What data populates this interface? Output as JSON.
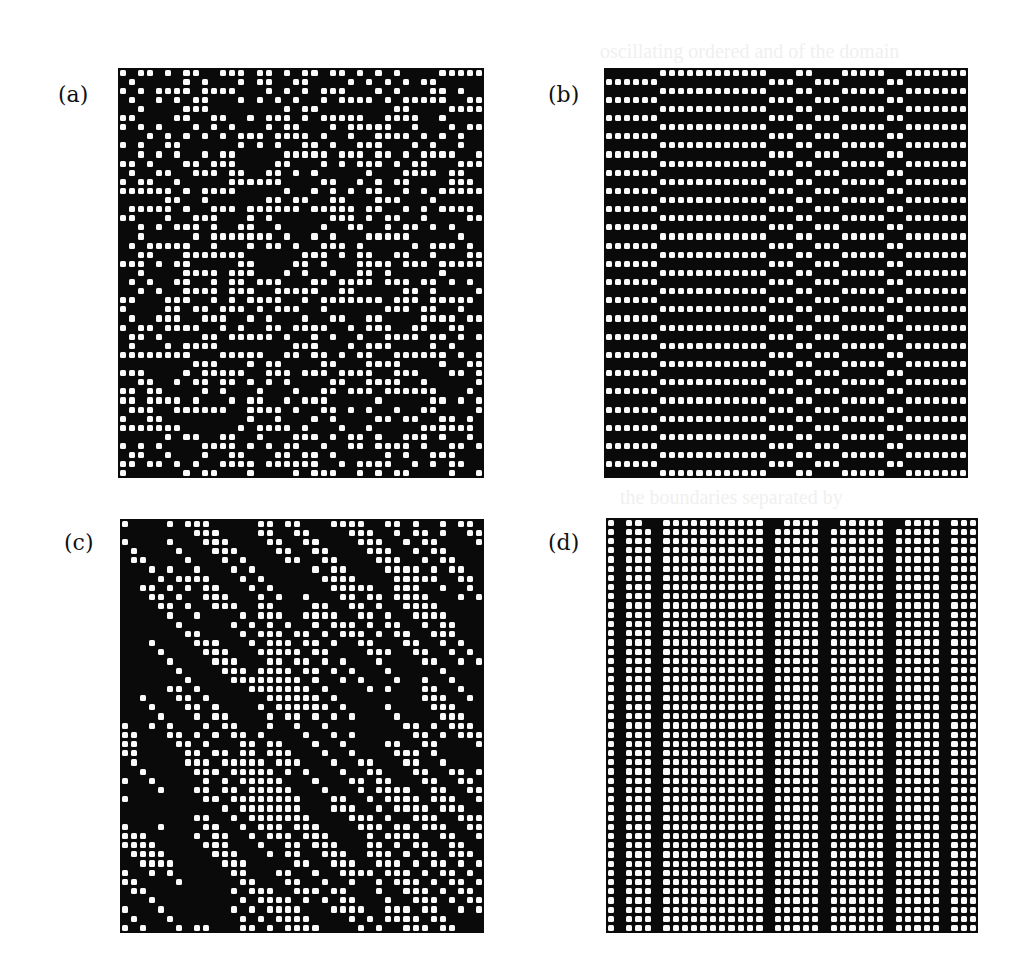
{
  "figure": {
    "panels": [
      {
        "id": "a",
        "label": "(a)",
        "label_pos": [
          58,
          82
        ],
        "rect": [
          118,
          68,
          366,
          410
        ],
        "cols": 40,
        "rows": 45,
        "pattern": "random-rule",
        "description": "disordered space-time pattern with short horizontal white runs"
      },
      {
        "id": "b",
        "label": "(b)",
        "label_pos": [
          548,
          82
        ],
        "rect": [
          604,
          68,
          364,
          410
        ],
        "cols": 40,
        "rows": 45,
        "pattern": "phase-bands",
        "bands": [
          {
            "from": 0,
            "to": 0,
            "phase": 1
          },
          {
            "from": 1,
            "to": 5,
            "phase": 1
          },
          {
            "from": 6,
            "to": 17,
            "phase": 0
          },
          {
            "from": 18,
            "to": 20,
            "phase": 1
          },
          {
            "from": 21,
            "to": 22,
            "phase": 0
          },
          {
            "from": 23,
            "to": 25,
            "phase": 1
          },
          {
            "from": 26,
            "to": 30,
            "phase": 0
          },
          {
            "from": 31,
            "to": 32,
            "phase": 1
          },
          {
            "from": 33,
            "to": 39,
            "phase": 0
          }
        ],
        "description": "horizontal stripes alternating by row with phase domains separated by vertical walls"
      },
      {
        "id": "c",
        "label": "(c)",
        "label_pos": [
          64,
          530
        ],
        "rect": [
          120,
          519,
          364,
          414
        ],
        "cols": 40,
        "rows": 45,
        "pattern": "diagonal-random",
        "description": "disordered pattern with diagonal domain walls moving up-right"
      },
      {
        "id": "d",
        "label": "(d)",
        "label_pos": [
          548,
          530
        ],
        "rect": [
          606,
          518,
          372,
          415
        ],
        "cols": 40,
        "rows": 45,
        "pattern": "stripes",
        "black_columns": [
          1,
          5,
          17,
          23,
          30,
          36
        ],
        "top_defects": [
          4,
          18,
          24,
          31
        ],
        "description": "uniform white lattice interrupted by static black vertical stripes"
      }
    ],
    "ghost_text": [
      {
        "text": "oscillating ordered and of the domain",
        "pos": [
          600,
          58
        ]
      },
      {
        "text": "the boundaries separated by",
        "pos": [
          620,
          498
        ]
      }
    ]
  }
}
